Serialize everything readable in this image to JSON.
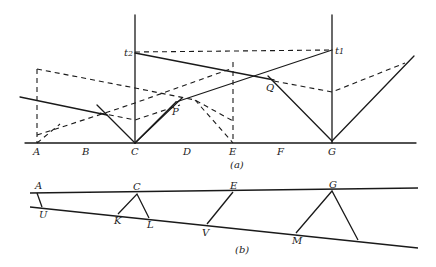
{
  "diagram_a": {
    "caption": "(a)",
    "baseline_labels": [
      "A",
      "B",
      "C",
      "D",
      "E",
      "F",
      "G"
    ],
    "points": {
      "P": "P",
      "Q": "Q"
    },
    "time_labels": {
      "t2": "t",
      "t2_sub": "2",
      "t1": "t",
      "t1_sub": "1"
    }
  },
  "diagram_b": {
    "caption": "(b)",
    "top_labels": [
      "A",
      "C",
      "E",
      "G"
    ],
    "bottom_labels": [
      "U",
      "K",
      "L",
      "V",
      "M"
    ]
  },
  "colors": {
    "line": "#1a1a1a",
    "background": "#ffffff"
  }
}
